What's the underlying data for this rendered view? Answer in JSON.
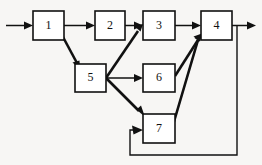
{
  "diagram": {
    "type": "flowchart",
    "colors": {
      "background": "#f7f6f4",
      "box_fill": "#ffffff",
      "stroke": "#111111"
    },
    "nodes": [
      {
        "id": "n1",
        "label": "1",
        "x": 33,
        "y": 11,
        "w": 31,
        "h": 29
      },
      {
        "id": "n2",
        "label": "2",
        "x": 95,
        "y": 11,
        "w": 30,
        "h": 29
      },
      {
        "id": "n3",
        "label": "3",
        "x": 143,
        "y": 11,
        "w": 32,
        "h": 29
      },
      {
        "id": "n4",
        "label": "4",
        "x": 201,
        "y": 11,
        "w": 31,
        "h": 29
      },
      {
        "id": "n5",
        "label": "5",
        "x": 75,
        "y": 64,
        "w": 31,
        "h": 28
      },
      {
        "id": "n6",
        "label": "6",
        "x": 143,
        "y": 64,
        "w": 32,
        "h": 28
      },
      {
        "id": "n7",
        "label": "7",
        "x": 143,
        "y": 114,
        "w": 32,
        "h": 29
      }
    ],
    "edges": [
      {
        "id": "e-in-1",
        "from": "input",
        "to": "n1",
        "style": "thin",
        "shape": "horizontal"
      },
      {
        "id": "e-1-2",
        "from": "n1",
        "to": "n2",
        "style": "thin",
        "shape": "horizontal"
      },
      {
        "id": "e-2-3",
        "from": "n2",
        "to": "n3",
        "style": "thin",
        "shape": "horizontal"
      },
      {
        "id": "e-3-4",
        "from": "n3",
        "to": "n4",
        "style": "thin",
        "shape": "horizontal"
      },
      {
        "id": "e-4-out",
        "from": "n4",
        "to": "output",
        "style": "thin",
        "shape": "horizontal"
      },
      {
        "id": "e-1-5",
        "from": "n1",
        "to": "n5",
        "style": "thick",
        "shape": "diagonal"
      },
      {
        "id": "e-5-3",
        "from": "n5",
        "to": "n3",
        "style": "thick",
        "shape": "diagonal"
      },
      {
        "id": "e-5-6",
        "from": "n5",
        "to": "n6",
        "style": "thin",
        "shape": "horizontal"
      },
      {
        "id": "e-5-7",
        "from": "n5",
        "to": "n7",
        "style": "thick",
        "shape": "diagonal"
      },
      {
        "id": "e-6-4",
        "from": "n6",
        "to": "n4",
        "style": "thick",
        "shape": "diagonal"
      },
      {
        "id": "e-7-4",
        "from": "n7",
        "to": "n4",
        "style": "thick",
        "shape": "diagonal"
      },
      {
        "id": "e-fb-4-7",
        "from": "n4",
        "to": "n7",
        "style": "feedback",
        "shape": "orthogonal-loop"
      }
    ]
  }
}
